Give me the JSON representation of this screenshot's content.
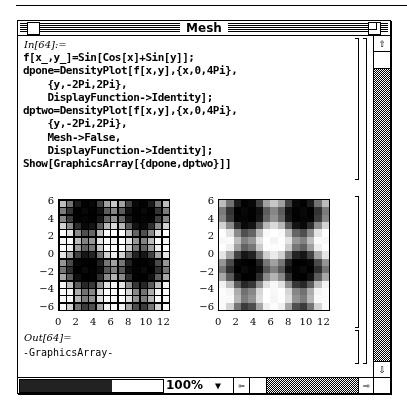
{
  "window": {
    "title": "Mesh",
    "zoom_level": "100%"
  },
  "notebook": {
    "input_label": "In[64]:=",
    "code_lines": [
      "f[x_,y_]=Sin[Cos[x]+Sin[y]];",
      "dpone=DensityPlot[f[x,y],{x,0,4Pi},",
      "    {y,-2Pi,2Pi},",
      "    DisplayFunction->Identity];",
      "dptwo=DensityPlot[f[x,y],{x,0,4Pi},",
      "    {y,-2Pi,2Pi},",
      "    Mesh->False,",
      "    DisplayFunction->Identity];",
      "Show[GraphicsArray[{dpone,dptwo}]]"
    ],
    "output_label": "Out[64]=",
    "output_value": "-GraphicsArray-"
  },
  "icons": {
    "scroll_up": "⇧",
    "scroll_down": "⇩",
    "scroll_left": "⇦",
    "scroll_right": "⇨",
    "dropdown": "▼"
  },
  "chart_data": [
    {
      "type": "heatmap",
      "title": "dpone (DensityPlot, Mesh->True)",
      "function": "Sin[Cos[x]+Sin[y]]",
      "x_range": [
        0,
        12.566
      ],
      "y_range": [
        -6.283,
        6.283
      ],
      "x_ticks": [
        "0",
        "2",
        "4",
        "6",
        "8",
        "10",
        "12"
      ],
      "y_ticks": [
        "6",
        "4",
        "2",
        "0",
        "-2",
        "-4",
        "-6"
      ],
      "mesh": true,
      "grid": [
        15,
        15
      ]
    },
    {
      "type": "heatmap",
      "title": "dptwo (DensityPlot, Mesh->False)",
      "function": "Sin[Cos[x]+Sin[y]]",
      "x_range": [
        0,
        12.566
      ],
      "y_range": [
        -6.283,
        6.283
      ],
      "x_ticks": [
        "0",
        "2",
        "4",
        "6",
        "8",
        "10",
        "12"
      ],
      "y_ticks": [
        "6",
        "4",
        "2",
        "0",
        "-2",
        "-4",
        "-6"
      ],
      "mesh": false,
      "grid": [
        15,
        15
      ]
    }
  ]
}
